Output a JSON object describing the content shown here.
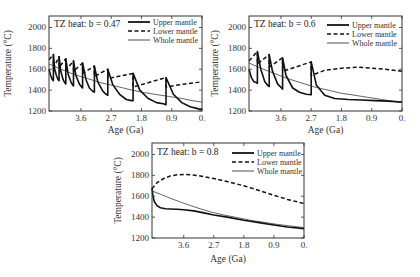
{
  "chart_data": [
    {
      "type": "line",
      "title": "TZ heat: b = 0.47",
      "xlabel": "Age (Ga)",
      "ylabel": "Temperature (°C)",
      "xlim": [
        4.55,
        0.0
      ],
      "ylim": [
        1200,
        2110
      ],
      "xticks": [
        3.6,
        2.7,
        1.8,
        0.9,
        0.0
      ],
      "xtick_labels": [
        "3.6",
        "2.7",
        "1.8",
        "0.9",
        "0."
      ],
      "yticks": [
        1200,
        1400,
        1600,
        1800,
        2000
      ],
      "ytick_labels": [
        "1200",
        "1400",
        "1600",
        "1800",
        "2000"
      ],
      "grid": false,
      "legend_position": "upper right",
      "series": [
        {
          "name": "Upper mantle",
          "style": "solid-thick",
          "x": [
            4.55,
            4.5,
            4.45,
            4.42,
            4.42,
            4.38,
            4.33,
            4.28,
            4.25,
            4.25,
            4.2,
            4.13,
            4.08,
            4.05,
            4.05,
            3.98,
            3.9,
            3.85,
            3.82,
            3.82,
            3.75,
            3.65,
            3.58,
            3.55,
            3.55,
            3.45,
            3.35,
            3.25,
            3.2,
            3.2,
            3.1,
            2.95,
            2.85,
            2.8,
            2.8,
            2.65,
            2.45,
            2.25,
            2.1,
            2.05,
            2.05,
            1.85,
            1.6,
            1.35,
            1.15,
            1.07,
            1.07,
            0.85,
            0.6,
            0.35,
            0.1,
            0.0
          ],
          "y": [
            1600,
            1540,
            1500,
            1490,
            1740,
            1600,
            1540,
            1500,
            1490,
            1720,
            1580,
            1500,
            1470,
            1460,
            1700,
            1550,
            1480,
            1450,
            1440,
            1680,
            1540,
            1460,
            1430,
            1420,
            1660,
            1500,
            1420,
            1390,
            1380,
            1630,
            1480,
            1390,
            1360,
            1350,
            1600,
            1450,
            1360,
            1310,
            1300,
            1300,
            1560,
            1400,
            1320,
            1280,
            1270,
            1260,
            1520,
            1360,
            1280,
            1240,
            1220,
            1215
          ]
        },
        {
          "name": "Lower mantle",
          "style": "dashed",
          "x": [
            4.55,
            4.42,
            4.42,
            4.25,
            4.25,
            4.05,
            4.05,
            3.82,
            3.82,
            3.55,
            3.55,
            3.2,
            3.2,
            2.8,
            2.8,
            2.05,
            2.05,
            1.07,
            1.07,
            0.5,
            0.0
          ],
          "y": [
            1690,
            1740,
            1610,
            1720,
            1620,
            1700,
            1590,
            1680,
            1580,
            1660,
            1560,
            1630,
            1530,
            1600,
            1510,
            1560,
            1430,
            1520,
            1430,
            1460,
            1480
          ]
        },
        {
          "name": "Whole mantle",
          "style": "solid-thin",
          "x": [
            4.55,
            4.2,
            3.8,
            3.4,
            3.0,
            2.6,
            2.2,
            1.8,
            1.4,
            1.0,
            0.6,
            0.3,
            0.0
          ],
          "y": [
            1650,
            1600,
            1550,
            1510,
            1470,
            1440,
            1410,
            1380,
            1360,
            1340,
            1320,
            1300,
            1285
          ]
        }
      ]
    },
    {
      "type": "line",
      "title": "TZ heat: b = 0.6",
      "xlabel": "Age (Ga)",
      "ylabel": "Temperature (°C)",
      "xlim": [
        4.55,
        0.0
      ],
      "ylim": [
        1200,
        2110
      ],
      "xticks": [
        3.6,
        2.7,
        1.8,
        0.9,
        0.0
      ],
      "xtick_labels": [
        "3.6",
        "2.7",
        "1.8",
        "0.9",
        "0."
      ],
      "yticks": [
        1200,
        1400,
        1600,
        1800,
        2000
      ],
      "ytick_labels": [
        "1200",
        "1400",
        "1600",
        "1800",
        "2000"
      ],
      "grid": false,
      "legend_position": "upper right",
      "series": [
        {
          "name": "Upper mantle",
          "style": "solid-thick",
          "x": [
            4.55,
            4.48,
            4.4,
            4.32,
            4.3,
            4.3,
            4.2,
            4.08,
            3.98,
            3.95,
            3.95,
            3.85,
            3.7,
            3.58,
            3.55,
            3.55,
            3.45,
            3.25,
            3.05,
            2.85,
            2.7,
            2.7,
            2.55,
            2.3,
            2.0,
            1.6,
            1.2,
            0.8,
            0.4,
            0.0
          ],
          "y": [
            1600,
            1520,
            1480,
            1470,
            1465,
            1770,
            1600,
            1480,
            1440,
            1435,
            1740,
            1580,
            1460,
            1420,
            1410,
            1710,
            1540,
            1420,
            1380,
            1360,
            1355,
            1670,
            1450,
            1350,
            1320,
            1310,
            1305,
            1300,
            1295,
            1285
          ]
        },
        {
          "name": "Lower mantle",
          "style": "dashed",
          "x": [
            4.55,
            4.3,
            4.3,
            3.95,
            3.95,
            3.55,
            3.55,
            2.7,
            2.7,
            2.3,
            1.8,
            1.3,
            0.9,
            0.5,
            0.0
          ],
          "y": [
            1680,
            1770,
            1650,
            1740,
            1620,
            1710,
            1580,
            1670,
            1540,
            1590,
            1610,
            1620,
            1610,
            1600,
            1580
          ]
        },
        {
          "name": "Whole mantle",
          "style": "solid-thin",
          "x": [
            4.55,
            4.2,
            3.8,
            3.4,
            3.0,
            2.6,
            2.2,
            1.8,
            1.4,
            1.0,
            0.6,
            0.3,
            0.0
          ],
          "y": [
            1660,
            1610,
            1560,
            1510,
            1470,
            1430,
            1400,
            1370,
            1350,
            1330,
            1310,
            1295,
            1280
          ]
        }
      ]
    },
    {
      "type": "line",
      "title": "TZ heat: b = 0.8",
      "xlabel": "Age (Ga)",
      "ylabel": "Temperature (°C)",
      "xlim": [
        4.55,
        0.0
      ],
      "ylim": [
        1200,
        2110
      ],
      "xticks": [
        3.6,
        2.7,
        1.8,
        0.9,
        0.0
      ],
      "xtick_labels": [
        "3.6",
        "2.7",
        "1.8",
        "0.9",
        "0."
      ],
      "yticks": [
        1200,
        1400,
        1600,
        1800,
        2000
      ],
      "ytick_labels": [
        "1200",
        "1400",
        "1600",
        "1800",
        "2000"
      ],
      "grid": false,
      "legend_position": "upper right",
      "series": [
        {
          "name": "Upper mantle",
          "style": "solid-thick",
          "x": [
            4.55,
            4.52,
            4.48,
            4.4,
            4.3,
            4.15,
            4.0,
            3.8,
            3.6,
            3.3,
            3.0,
            2.7,
            2.3,
            1.8,
            1.3,
            0.9,
            0.5,
            0.0
          ],
          "y": [
            1680,
            1600,
            1550,
            1510,
            1490,
            1480,
            1478,
            1476,
            1470,
            1460,
            1440,
            1420,
            1400,
            1370,
            1345,
            1325,
            1305,
            1290
          ]
        },
        {
          "name": "Lower mantle",
          "style": "dashed",
          "x": [
            4.55,
            4.4,
            4.2,
            4.0,
            3.8,
            3.6,
            3.4,
            3.1,
            2.7,
            2.3,
            1.8,
            1.3,
            0.9,
            0.5,
            0.0
          ],
          "y": [
            1670,
            1730,
            1770,
            1795,
            1805,
            1808,
            1805,
            1795,
            1770,
            1740,
            1700,
            1650,
            1610,
            1570,
            1530
          ]
        },
        {
          "name": "Whole mantle",
          "style": "solid-thin",
          "x": [
            4.55,
            4.3,
            4.0,
            3.7,
            3.4,
            3.1,
            2.8,
            2.4,
            2.0,
            1.6,
            1.2,
            0.8,
            0.4,
            0.0
          ],
          "y": [
            1650,
            1620,
            1580,
            1545,
            1510,
            1480,
            1450,
            1420,
            1395,
            1370,
            1350,
            1330,
            1315,
            1300
          ]
        }
      ]
    }
  ],
  "panels": [
    {
      "title": "TZ heat: b = 0.47",
      "xlabel": "Age (Ga)",
      "ylabel": "Temperature (°C)",
      "legend": [
        "Upper mantle",
        "Lower mantle",
        "Whole mantle"
      ]
    },
    {
      "title": "TZ heat: b = 0.6",
      "xlabel": "Age (Ga)",
      "ylabel": "Temperature (°C)",
      "legend": [
        "Upper mantle",
        "Lower mantle",
        "Whole mantle"
      ]
    },
    {
      "title": "TZ heat: b = 0.8",
      "xlabel": "Age (Ga)",
      "ylabel": "Temperature (°C)",
      "legend": [
        "Upper mantle",
        "Lower mantle",
        "Whole mantle"
      ]
    }
  ],
  "colors": {
    "line": "#111111",
    "thin_line": "#222222",
    "frame": "#333333",
    "text": "#333333"
  }
}
